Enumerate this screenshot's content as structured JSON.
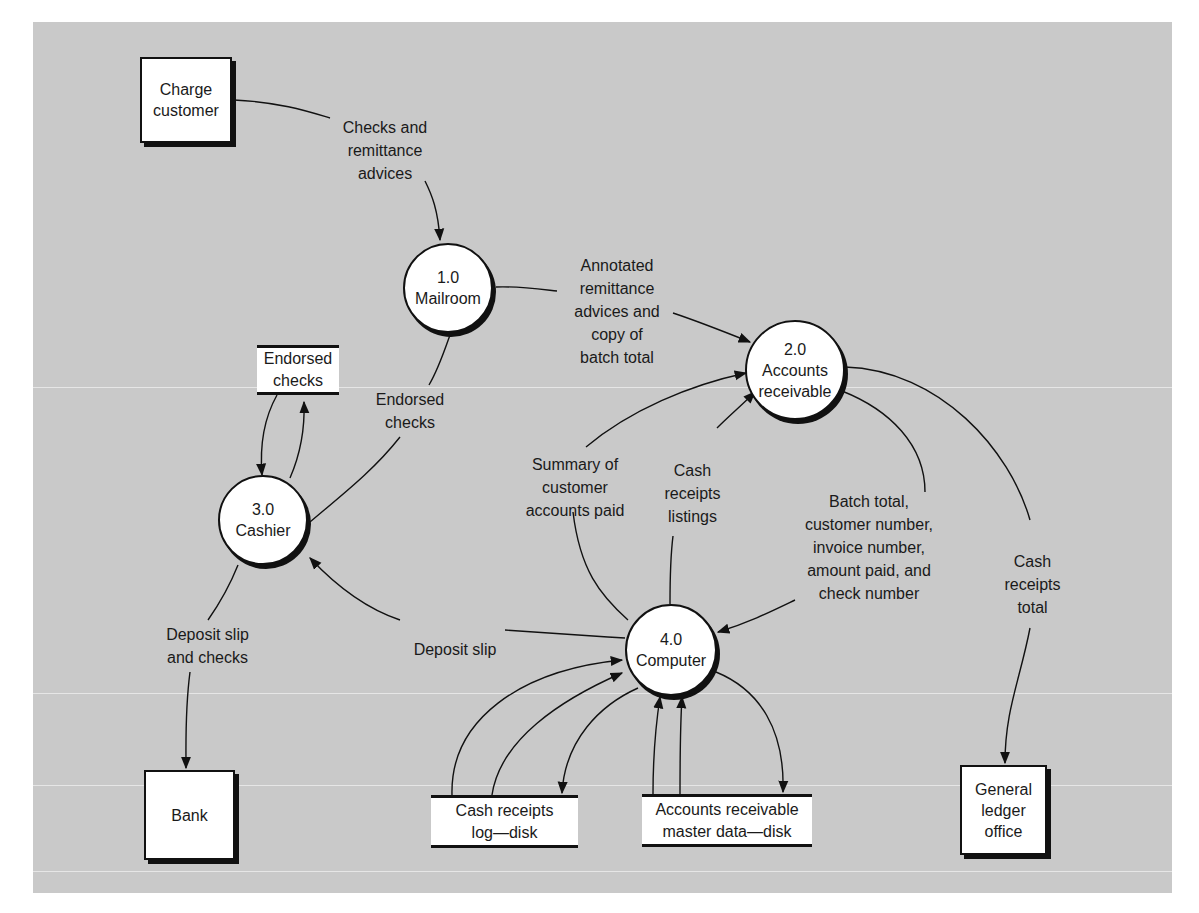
{
  "diagram": {
    "type": "data-flow-diagram",
    "external_entities": [
      {
        "id": "charge-customer",
        "label": "Charge\ncustomer"
      },
      {
        "id": "bank",
        "label": "Bank"
      },
      {
        "id": "general-ledger-office",
        "label": "General\nledger\noffice"
      }
    ],
    "processes": [
      {
        "id": "1.0",
        "number": "1.0",
        "label": "Mailroom"
      },
      {
        "id": "2.0",
        "number": "2.0",
        "label": "Accounts\nreceivable"
      },
      {
        "id": "3.0",
        "number": "3.0",
        "label": "Cashier"
      },
      {
        "id": "4.0",
        "number": "4.0",
        "label": "Computer"
      }
    ],
    "data_stores": [
      {
        "id": "endorsed-checks",
        "label": "Endorsed\nchecks"
      },
      {
        "id": "cash-receipts-log",
        "label": "Cash receipts\nlog—disk"
      },
      {
        "id": "ar-master",
        "label": "Accounts receivable\nmaster data—disk"
      }
    ],
    "flows": [
      {
        "from": "charge-customer",
        "to": "1.0",
        "label": "Checks and\nremittance\nadvices"
      },
      {
        "from": "1.0",
        "to": "2.0",
        "label": "Annotated\nremittance\nadvices and\ncopy of\nbatch total"
      },
      {
        "from": "1.0",
        "to": "3.0",
        "label": "Endorsed\nchecks"
      },
      {
        "from": "endorsed-checks",
        "to": "3.0",
        "label": ""
      },
      {
        "from": "3.0",
        "to": "endorsed-checks",
        "label": ""
      },
      {
        "from": "4.0",
        "to": "2.0",
        "label": "Summary of\ncustomer\naccounts paid"
      },
      {
        "from": "4.0",
        "to": "2.0",
        "label": "Cash\nreceipts\nlistings"
      },
      {
        "from": "2.0",
        "to": "4.0",
        "label": "Batch total,\ncustomer number,\ninvoice number,\namount paid, and\ncheck number"
      },
      {
        "from": "2.0",
        "to": "general-ledger-office",
        "label": "Cash\nreceipts\ntotal"
      },
      {
        "from": "4.0",
        "to": "3.0",
        "label": "Deposit slip"
      },
      {
        "from": "3.0",
        "to": "bank",
        "label": "Deposit slip\nand checks"
      },
      {
        "from": "cash-receipts-log",
        "to": "4.0",
        "label": ""
      },
      {
        "from": "cash-receipts-log",
        "to": "4.0",
        "label": ""
      },
      {
        "from": "4.0",
        "to": "cash-receipts-log",
        "label": ""
      },
      {
        "from": "ar-master",
        "to": "4.0",
        "label": ""
      },
      {
        "from": "ar-master",
        "to": "4.0",
        "label": ""
      },
      {
        "from": "4.0",
        "to": "ar-master",
        "label": ""
      }
    ]
  },
  "colors": {
    "background": "#c9c9c9",
    "node_fill": "#ffffff",
    "stroke": "#111111"
  }
}
